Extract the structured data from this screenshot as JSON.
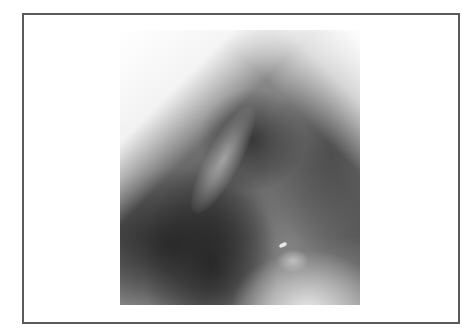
{
  "image": {
    "type": "radiograph",
    "description": "Lateral chest X-ray, grayscale",
    "tones": {
      "darkest": "#333333",
      "midtone": "#777777",
      "brightest": "#f4f4f4"
    }
  },
  "frame": {
    "border_color": "#5a5a5a",
    "background": "#ffffff"
  }
}
